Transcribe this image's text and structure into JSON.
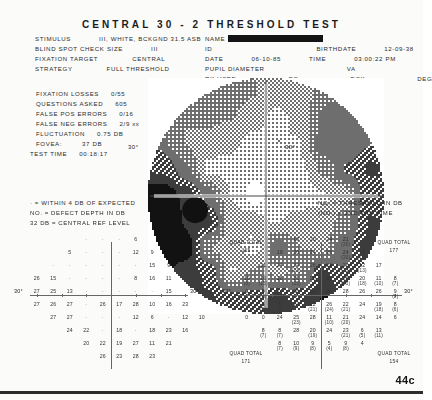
{
  "title": "CENTRAL 30 - 2 THRESHOLD TEST",
  "page_number": "44c",
  "eye_label": "LEFT",
  "header": {
    "stimulus_label": "STIMULUS",
    "stimulus_value": "III, WHITE, BCKGND 31.5 ASB",
    "blind_spot_label": "BLIND SPOT CHECK SIZE",
    "blind_spot_value": "III",
    "fixation_target_label": "FIXATION TARGET",
    "fixation_target_value": "CENTRAL",
    "strategy_label": "STRATEGY",
    "strategy_value": "FULL THRESHOLD",
    "name_label": "NAME",
    "name_value": "",
    "id_label": "ID",
    "id_value": "",
    "birthdate_label": "BIRTHDATE",
    "birthdate_value": "12-09-38",
    "date_label": "DATE",
    "date_value": "06-10-85",
    "time_label": "TIME",
    "time_value": "03:00:22 PM",
    "pupil_label": "PUPIL DIAMETER",
    "pupil_value": "",
    "va_label": "VA",
    "va_value": "",
    "rx_label": "RX USED",
    "ds_label": "DS",
    "dcx_label": "DCX",
    "deg_label": "DEG"
  },
  "reliability": {
    "fixation_losses_label": "FIXATION LOSSES",
    "fixation_losses_value": "0/55",
    "questions_asked_label": "QUESTIONS ASKED",
    "questions_asked_value": "605",
    "false_pos_label": "FALSE POS ERRORS",
    "false_pos_value": "0/16",
    "false_neg_label": "FALSE NEG ERRORS",
    "false_neg_value": "2/9 xx",
    "fluctuation_label": "FLUCTUATION",
    "fluctuation_value": "0.75 DB",
    "fovea_label": "FOVEA:",
    "fovea_value": "37 DB",
    "test_time_label": "TEST TIME",
    "test_time_value": "00:18:17"
  },
  "grayscale": {
    "left_deg": "30°",
    "right_deg": "30°"
  },
  "legend": {
    "left": [
      "· = WITHIN 4 DB OF EXPECTED",
      "NO. = DEFECT DEPTH IN DB",
      "32 DB    = CENTRAL REF LEVEL"
    ],
    "right": [
      "NO.  = THRESHOLD IN DB",
      "(NO.) = 2ND/3RD TIME"
    ]
  },
  "defect_grid": {
    "name": "defect-depth-grid",
    "deg_left": "30°",
    "deg_right": "30°",
    "cells": [
      {
        "c": 3,
        "r": 0,
        "v": "·"
      },
      {
        "c": 4,
        "r": 0,
        "v": "·"
      },
      {
        "c": 5,
        "r": 0,
        "v": "·"
      },
      {
        "c": 6,
        "r": 0,
        "v": "6"
      },
      {
        "c": 2,
        "r": 1,
        "v": "5"
      },
      {
        "c": 3,
        "r": 1,
        "v": "·"
      },
      {
        "c": 4,
        "r": 1,
        "v": "·"
      },
      {
        "c": 5,
        "r": 1,
        "v": "·"
      },
      {
        "c": 6,
        "r": 1,
        "v": "12"
      },
      {
        "c": 7,
        "r": 1,
        "v": "9"
      },
      {
        "c": 1,
        "r": 2,
        "v": "·"
      },
      {
        "c": 2,
        "r": 2,
        "v": "·"
      },
      {
        "c": 3,
        "r": 2,
        "v": "·"
      },
      {
        "c": 4,
        "r": 2,
        "v": "·"
      },
      {
        "c": 5,
        "r": 2,
        "v": "·"
      },
      {
        "c": 6,
        "r": 2,
        "v": "·"
      },
      {
        "c": 7,
        "r": 2,
        "v": "15"
      },
      {
        "c": 8,
        "r": 2,
        "v": "9"
      },
      {
        "c": 0,
        "r": 3,
        "v": "26"
      },
      {
        "c": 1,
        "r": 3,
        "v": "15"
      },
      {
        "c": 2,
        "r": 3,
        "v": "·"
      },
      {
        "c": 3,
        "r": 3,
        "v": "·"
      },
      {
        "c": 4,
        "r": 3,
        "v": "·"
      },
      {
        "c": 5,
        "r": 3,
        "v": "·"
      },
      {
        "c": 6,
        "r": 3,
        "v": "8"
      },
      {
        "c": 7,
        "r": 3,
        "v": "16"
      },
      {
        "c": 8,
        "r": 3,
        "v": "11"
      },
      {
        "c": 0,
        "r": 4,
        "v": "27"
      },
      {
        "c": 1,
        "r": 4,
        "v": "25"
      },
      {
        "c": 2,
        "r": 4,
        "v": "13"
      },
      {
        "c": 3,
        "r": 4,
        "v": "·"
      },
      {
        "c": 4,
        "r": 4,
        "v": "·"
      },
      {
        "c": 5,
        "r": 4,
        "v": "·"
      },
      {
        "c": 6,
        "r": 4,
        "v": "·"
      },
      {
        "c": 7,
        "r": 4,
        "v": "·"
      },
      {
        "c": 8,
        "r": 4,
        "v": "15"
      },
      {
        "c": 0,
        "r": 5,
        "v": "27"
      },
      {
        "c": 1,
        "r": 5,
        "v": "26"
      },
      {
        "c": 2,
        "r": 5,
        "v": "27"
      },
      {
        "c": 3,
        "r": 5,
        "v": "·"
      },
      {
        "c": 4,
        "r": 5,
        "v": "26"
      },
      {
        "c": 5,
        "r": 5,
        "v": "17"
      },
      {
        "c": 6,
        "r": 5,
        "v": "28"
      },
      {
        "c": 7,
        "r": 5,
        "v": "10"
      },
      {
        "c": 8,
        "r": 5,
        "v": "16"
      },
      {
        "c": 9,
        "r": 5,
        "v": "23"
      },
      {
        "c": 1,
        "r": 6,
        "v": "27"
      },
      {
        "c": 2,
        "r": 6,
        "v": "27"
      },
      {
        "c": 3,
        "r": 6,
        "v": "·"
      },
      {
        "c": 4,
        "r": 6,
        "v": "·"
      },
      {
        "c": 5,
        "r": 6,
        "v": "·"
      },
      {
        "c": 6,
        "r": 6,
        "v": "12"
      },
      {
        "c": 7,
        "r": 6,
        "v": "6"
      },
      {
        "c": 8,
        "r": 6,
        "v": "·"
      },
      {
        "c": 9,
        "r": 6,
        "v": "12"
      },
      {
        "c": 10,
        "r": 6,
        "v": "10"
      },
      {
        "c": 2,
        "r": 7,
        "v": "24"
      },
      {
        "c": 3,
        "r": 7,
        "v": "22"
      },
      {
        "c": 4,
        "r": 7,
        "v": "·"
      },
      {
        "c": 5,
        "r": 7,
        "v": "18"
      },
      {
        "c": 6,
        "r": 7,
        "v": "·"
      },
      {
        "c": 7,
        "r": 7,
        "v": "18"
      },
      {
        "c": 8,
        "r": 7,
        "v": "23"
      },
      {
        "c": 9,
        "r": 7,
        "v": "16"
      },
      {
        "c": 3,
        "r": 8,
        "v": "20"
      },
      {
        "c": 4,
        "r": 8,
        "v": "22"
      },
      {
        "c": 5,
        "r": 8,
        "v": "19"
      },
      {
        "c": 6,
        "r": 8,
        "v": "27"
      },
      {
        "c": 7,
        "r": 8,
        "v": "11"
      },
      {
        "c": 8,
        "r": 8,
        "v": "21"
      },
      {
        "c": 4,
        "r": 9,
        "v": "26"
      },
      {
        "c": 5,
        "r": 9,
        "v": "23"
      },
      {
        "c": 6,
        "r": 9,
        "v": "28"
      },
      {
        "c": 7,
        "r": 9,
        "v": "23"
      }
    ]
  },
  "threshold_grid": {
    "name": "threshold-grid",
    "deg_left": "30°",
    "deg_right": "30°",
    "quad_totals": [
      {
        "label": "QUAD TOTAL",
        "value": "365",
        "pos": "top-left"
      },
      {
        "label": "QUAD TOTAL",
        "value": "177",
        "pos": "top-right"
      },
      {
        "label": "QUAD TOTAL",
        "value": "171",
        "pos": "bottom-left"
      },
      {
        "label": "QUAD TOTAL",
        "value": "154",
        "pos": "bottom-right"
      }
    ],
    "cells": [
      {
        "c": 3,
        "r": 0,
        "v": "18"
      },
      {
        "c": 4,
        "r": 0,
        "v": "20"
      },
      {
        "c": 5,
        "r": 0,
        "v": "24"
      },
      {
        "c": 6,
        "r": 0,
        "v": "21",
        "s": "(20)"
      },
      {
        "c": 2,
        "r": 1,
        "v": "19"
      },
      {
        "c": 3,
        "r": 1,
        "v": "20"
      },
      {
        "c": 4,
        "r": 1,
        "v": "24"
      },
      {
        "c": 5,
        "r": 1,
        "v": "26"
      },
      {
        "c": 6,
        "r": 1,
        "v": "24",
        "s": "(20)"
      },
      {
        "c": 7,
        "r": 1,
        "v": "15",
        "s": "(16)"
      },
      {
        "c": 1,
        "r": 2,
        "v": "21"
      },
      {
        "c": 2,
        "r": 2,
        "v": "24"
      },
      {
        "c": 3,
        "r": 2,
        "v": "24",
        "s": "(23)"
      },
      {
        "c": 4,
        "r": 2,
        "v": "26"
      },
      {
        "c": 5,
        "r": 2,
        "v": "24"
      },
      {
        "c": 6,
        "r": 2,
        "v": "26",
        "s": "(25)"
      },
      {
        "c": 7,
        "r": 2,
        "v": "12",
        "s": "(13)"
      },
      {
        "c": 8,
        "r": 2,
        "v": "17"
      },
      {
        "c": 0,
        "r": 3,
        "v": "10",
        "s": "(9)"
      },
      {
        "c": 1,
        "r": 3,
        "v": "16",
        "s": "(15)"
      },
      {
        "c": 2,
        "r": 3,
        "v": "28"
      },
      {
        "c": 3,
        "r": 3,
        "v": "26",
        "s": "(25)"
      },
      {
        "c": 4,
        "r": 3,
        "v": "28"
      },
      {
        "c": 5,
        "r": 3,
        "v": "28"
      },
      {
        "c": 6,
        "r": 3,
        "v": "26",
        "s": "(25)"
      },
      {
        "c": 7,
        "r": 3,
        "v": "20",
        "s": "(18)"
      },
      {
        "c": 8,
        "r": 3,
        "v": "11",
        "s": "(10)"
      },
      {
        "c": 9,
        "r": 3,
        "v": "8",
        "s": "(7)"
      },
      {
        "c": 0,
        "r": 4,
        "v": "0"
      },
      {
        "c": 1,
        "r": 4,
        "v": "5",
        "s": "(4)"
      },
      {
        "c": 2,
        "r": 4,
        "v": "14",
        "s": "(13)"
      },
      {
        "c": 3,
        "r": 4,
        "v": "26"
      },
      {
        "c": 4,
        "r": 4,
        "v": "32"
      },
      {
        "c": 5,
        "r": 4,
        "v": "26"
      },
      {
        "c": 6,
        "r": 4,
        "v": "28"
      },
      {
        "c": 7,
        "r": 4,
        "v": "26"
      },
      {
        "c": 8,
        "r": 4,
        "v": "26"
      },
      {
        "c": 9,
        "r": 4,
        "v": "9",
        "s": "(8)"
      },
      {
        "c": 0,
        "r": 5,
        "v": "0"
      },
      {
        "c": 1,
        "r": 5,
        "v": "6",
        "s": "(5)"
      },
      {
        "c": 2,
        "r": 5,
        "v": "5",
        "s": "(4)"
      },
      {
        "c": 3,
        "r": 5,
        "v": "24"
      },
      {
        "c": 4,
        "r": 5,
        "v": "22",
        "s": "(21)"
      },
      {
        "c": 5,
        "r": 5,
        "v": "26",
        "s": "(24)"
      },
      {
        "c": 6,
        "r": 5,
        "v": "22",
        "s": "(21)"
      },
      {
        "c": 7,
        "r": 5,
        "v": "24"
      },
      {
        "c": 8,
        "r": 5,
        "v": "19",
        "s": "(18)"
      },
      {
        "c": 9,
        "r": 5,
        "v": "8",
        "s": "(6)"
      },
      {
        "c": 0,
        "r": 6,
        "v": "0"
      },
      {
        "c": 1,
        "r": 6,
        "v": "0"
      },
      {
        "c": 2,
        "r": 6,
        "v": "24"
      },
      {
        "c": 3,
        "r": 6,
        "v": "25",
        "s": "(23)"
      },
      {
        "c": 4,
        "r": 6,
        "v": "28"
      },
      {
        "c": 5,
        "r": 6,
        "v": "11",
        "s": "(10)"
      },
      {
        "c": 6,
        "r": 6,
        "v": "21",
        "s": "(20)"
      },
      {
        "c": 7,
        "r": 6,
        "v": "24"
      },
      {
        "c": 8,
        "r": 6,
        "v": "14"
      },
      {
        "c": 9,
        "r": 6,
        "v": "6"
      },
      {
        "c": 1,
        "r": 7,
        "v": "8",
        "s": "(7)"
      },
      {
        "c": 2,
        "r": 7,
        "v": "8",
        "s": "(7)"
      },
      {
        "c": 3,
        "r": 7,
        "v": "28"
      },
      {
        "c": 4,
        "r": 7,
        "v": "20",
        "s": "(19)"
      },
      {
        "c": 5,
        "r": 7,
        "v": "24"
      },
      {
        "c": 6,
        "r": 7,
        "v": "23",
        "s": "(21)"
      },
      {
        "c": 7,
        "r": 7,
        "v": "6",
        "s": "(5)"
      },
      {
        "c": 8,
        "r": 7,
        "v": "13",
        "s": "(11)"
      },
      {
        "c": 2,
        "r": 8,
        "v": "8",
        "s": "(7)"
      },
      {
        "c": 3,
        "r": 8,
        "v": "10",
        "s": "(9)"
      },
      {
        "c": 4,
        "r": 8,
        "v": "9",
        "s": "(8)"
      },
      {
        "c": 5,
        "r": 8,
        "v": "5",
        "s": "(4)"
      },
      {
        "c": 6,
        "r": 8,
        "v": "9",
        "s": "(8)"
      },
      {
        "c": 7,
        "r": 8,
        "v": "4"
      }
    ]
  }
}
